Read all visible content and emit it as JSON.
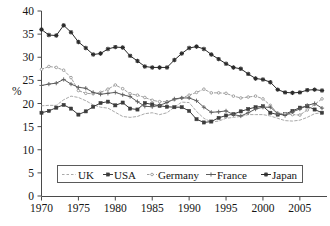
{
  "chart_data": {
    "type": "line",
    "title": "",
    "xlabel": "",
    "ylabel": "%",
    "xlim": [
      1970,
      2008
    ],
    "ylim": [
      0,
      40
    ],
    "ytick_step": 5,
    "yticks": [
      "0",
      "5",
      "10",
      "15",
      "20",
      "25",
      "30",
      "35",
      "40"
    ],
    "xticks": [
      "1970",
      "1975",
      "1980",
      "1985",
      "1990",
      "1995",
      "2000",
      "2005"
    ],
    "xtick_values": [
      1970,
      1975,
      1980,
      1985,
      1990,
      1995,
      2000,
      2005
    ],
    "grid": false,
    "legend_position": "bottom-inside",
    "x": [
      1970,
      1971,
      1972,
      1973,
      1974,
      1975,
      1976,
      1977,
      1978,
      1979,
      1980,
      1981,
      1982,
      1983,
      1984,
      1985,
      1986,
      1987,
      1988,
      1989,
      1990,
      1991,
      1992,
      1993,
      1994,
      1995,
      1996,
      1997,
      1998,
      1999,
      2000,
      2001,
      2002,
      2003,
      2004,
      2005,
      2006,
      2007,
      2008
    ],
    "series": [
      {
        "name": "UK",
        "color": "#9a9a9a",
        "style": "dashed",
        "marker": "none",
        "values": [
          19.5,
          19.6,
          19.6,
          20.8,
          21.6,
          21.3,
          20.6,
          19.7,
          19.2,
          19.0,
          18.1,
          17.2,
          17.0,
          17.2,
          17.8,
          18.0,
          17.6,
          18.0,
          19.2,
          20.3,
          20.2,
          18.3,
          16.8,
          16.0,
          16.2,
          16.8,
          17.0,
          17.2,
          17.6,
          17.6,
          17.6,
          17.3,
          16.8,
          16.3,
          16.2,
          16.4,
          17.0,
          17.8,
          18.0
        ]
      },
      {
        "name": "USA",
        "color": "#3c3c3c",
        "style": "solid",
        "marker": "square",
        "values": [
          18.0,
          18.4,
          19.1,
          19.7,
          18.9,
          17.6,
          18.3,
          19.3,
          20.1,
          20.4,
          19.6,
          20.2,
          18.9,
          18.7,
          20.1,
          19.8,
          19.5,
          19.3,
          19.2,
          19.2,
          18.4,
          16.6,
          15.9,
          16.1,
          16.9,
          17.4,
          17.7,
          18.3,
          18.8,
          19.2,
          19.4,
          18.0,
          17.6,
          17.7,
          18.4,
          19.1,
          19.4,
          18.7,
          18.0
        ]
      },
      {
        "name": "Germany",
        "color": "#8e8e8e",
        "style": "dashed",
        "marker": "dot",
        "values": [
          27.4,
          28.0,
          27.8,
          27.2,
          25.6,
          22.8,
          22.2,
          22.1,
          22.4,
          23.1,
          24.0,
          23.2,
          22.1,
          21.8,
          21.3,
          20.7,
          20.4,
          20.4,
          20.8,
          21.2,
          21.8,
          22.4,
          23.1,
          22.3,
          22.3,
          22.2,
          21.6,
          21.2,
          21.4,
          21.6,
          21.0,
          19.6,
          17.9,
          17.8,
          17.6,
          17.5,
          18.6,
          19.8,
          21.0
        ]
      },
      {
        "name": "France",
        "color": "#5c5c5c",
        "style": "solid",
        "marker": "plus",
        "values": [
          23.9,
          24.2,
          24.4,
          25.2,
          24.2,
          23.5,
          23.3,
          22.4,
          22.0,
          22.2,
          22.4,
          21.9,
          21.5,
          20.4,
          19.4,
          19.3,
          19.6,
          20.2,
          21.0,
          21.2,
          21.2,
          20.6,
          19.2,
          18.1,
          18.2,
          18.4,
          17.6,
          17.3,
          18.0,
          18.8,
          19.2,
          19.2,
          17.8,
          17.4,
          18.2,
          18.8,
          19.6,
          20.0,
          19.0
        ]
      },
      {
        "name": "Japan",
        "color": "#2a2a2a",
        "style": "solid",
        "marker": "star",
        "values": [
          36.0,
          34.8,
          34.7,
          36.9,
          35.4,
          33.3,
          32.0,
          30.6,
          30.8,
          31.8,
          32.2,
          32.1,
          30.3,
          29.2,
          28.0,
          27.8,
          27.8,
          27.8,
          29.4,
          30.8,
          32.0,
          32.3,
          31.8,
          30.6,
          29.6,
          28.6,
          27.8,
          27.5,
          26.4,
          25.4,
          25.2,
          24.6,
          23.0,
          22.4,
          22.3,
          22.4,
          22.9,
          23.0,
          22.8
        ]
      }
    ]
  },
  "legend": {
    "items": [
      {
        "label": "UK"
      },
      {
        "label": "USA"
      },
      {
        "label": "Germany"
      },
      {
        "label": "France"
      },
      {
        "label": "Japan"
      }
    ]
  }
}
